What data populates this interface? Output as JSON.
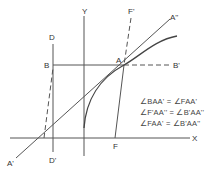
{
  "diagram": {
    "labels": {
      "y_axis": "Y",
      "x_axis": "X",
      "d_top": "D",
      "d_bottom": "D'",
      "b_left": "B",
      "b_right": "B'",
      "a_point": "A",
      "a_prime": "A'",
      "a_double_prime": "A''",
      "f_prime": "F'",
      "f_point": "F"
    },
    "equations": [
      "∠BAA' = ∠FAA'",
      "∠F'AA'' = ∠B'AA''",
      "∠FAA' = ∠B'AA''"
    ],
    "colors": {
      "line": "#555555",
      "background": "#ffffff"
    }
  }
}
